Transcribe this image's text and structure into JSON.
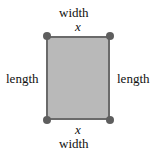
{
  "diagram": {
    "shape": "rectangle",
    "fill_color": "#b9b9b9",
    "border_color": "#6a6a6a",
    "vertex_color": "#5e5e5e",
    "labels": {
      "top_word": "width",
      "top_var": "x",
      "bottom_var": "x",
      "bottom_word": "width",
      "left": "length",
      "right": "length"
    }
  }
}
